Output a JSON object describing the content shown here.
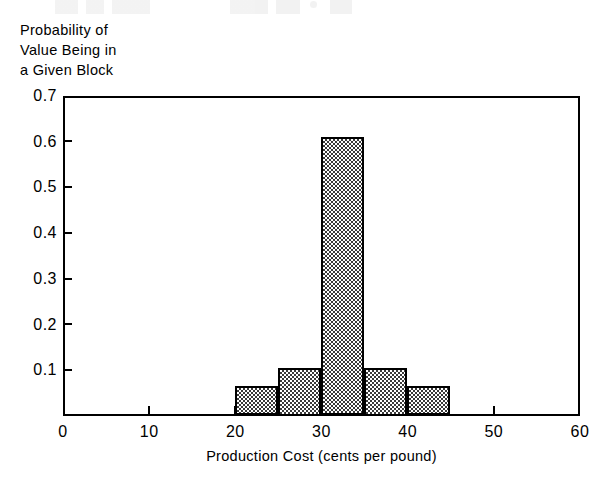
{
  "chart_data": {
    "type": "bar",
    "title": "",
    "xlabel": "Production Cost (cents per pound)",
    "ylabel": "Probability of Value Being in a Given Block",
    "ylabel_lines": [
      "Probability of",
      "Value Being in",
      "a Given Block"
    ],
    "xlim": [
      0,
      60
    ],
    "ylim": [
      0,
      0.7
    ],
    "xticks": [
      0,
      10,
      20,
      30,
      40,
      50,
      60
    ],
    "xtick_labels": [
      "0",
      "10",
      "20",
      "30",
      "40",
      "50",
      "60"
    ],
    "yticks": [
      0.1,
      0.2,
      0.3,
      0.4,
      0.5,
      0.6,
      0.7
    ],
    "ytick_labels": [
      "0.1",
      "0.2",
      "0.3",
      "0.4",
      "0.5",
      "0.6",
      "0.7"
    ],
    "grid": false,
    "legend": null,
    "bin_width": 5,
    "bin_edges": [
      20,
      25,
      30,
      35,
      40,
      45
    ],
    "categories": [
      "20-25",
      "25-30",
      "30-35",
      "35-40",
      "40-45"
    ],
    "values": [
      0.065,
      0.105,
      0.61,
      0.105,
      0.065
    ],
    "bars": [
      {
        "x0": 20,
        "x1": 25,
        "value": 0.065
      },
      {
        "x0": 25,
        "x1": 30,
        "value": 0.105
      },
      {
        "x0": 30,
        "x1": 35,
        "value": 0.61
      },
      {
        "x0": 35,
        "x1": 40,
        "value": 0.105
      },
      {
        "x0": 40,
        "x1": 45,
        "value": 0.065
      }
    ],
    "bar_fill": "#3a3a3a",
    "bar_edge_color": "#000000",
    "axis_color": "#000000",
    "background": "#ffffff"
  }
}
